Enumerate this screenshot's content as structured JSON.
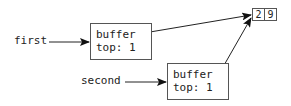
{
  "diagram": {
    "variables": [
      {
        "name": "first"
      },
      {
        "name": "second"
      }
    ],
    "objects": [
      {
        "field1": "buffer",
        "field2": "top: 1"
      },
      {
        "field1": "buffer",
        "field2": "top: 1"
      }
    ],
    "array": {
      "cells": [
        "2",
        "9"
      ]
    },
    "colors": {
      "stroke": "#222222",
      "box_border": "#555555"
    }
  }
}
